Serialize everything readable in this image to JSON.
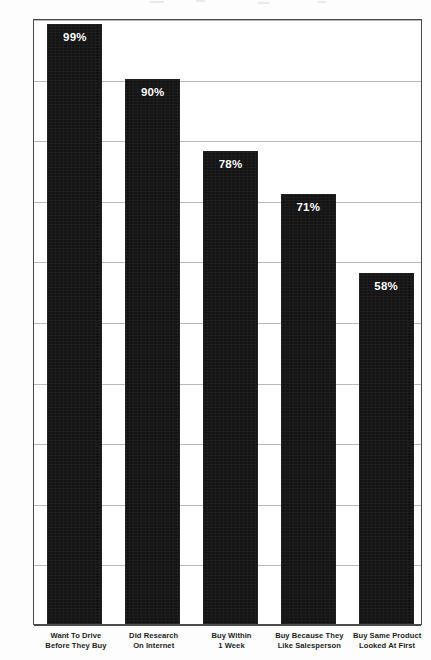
{
  "chart_data": {
    "type": "bar",
    "title": "",
    "subtitle": "",
    "xlabel": "",
    "ylabel": "",
    "ylim": [
      0,
      100
    ],
    "grid": true,
    "legend": false,
    "legend_position": "none",
    "orientation": "vertical",
    "bar_color": "#141414",
    "value_label_color": "#ffffff",
    "gridline_color": "#b9b9b9",
    "axis_color": "#4a4a4a",
    "categories": [
      "Want To Drive Before They Buy",
      "Did Research On Internet",
      "Buy Within 1 Week",
      "Buy Because They Like Salesperson",
      "Buy Same Product Looked At First"
    ],
    "category_lines": [
      [
        "Want To Drive",
        "Before They Buy"
      ],
      [
        "Did Research",
        "On Internet"
      ],
      [
        "Buy Within",
        "1 Week"
      ],
      [
        "Buy Because They",
        "Like Salesperson"
      ],
      [
        "Buy Same Product",
        "Looked At First"
      ]
    ],
    "values": [
      99,
      90,
      78,
      71,
      58
    ],
    "value_labels": [
      "99%",
      "90%",
      "78%",
      "71%",
      "58%"
    ],
    "yticks": [
      0,
      10,
      20,
      30,
      40,
      50,
      60,
      70,
      80,
      90,
      100
    ],
    "ytick_labels": [
      "0%",
      "10%",
      "20%",
      "30%",
      "40%",
      "50%",
      "60%",
      "70%",
      "80%",
      "90%",
      "100%"
    ]
  }
}
